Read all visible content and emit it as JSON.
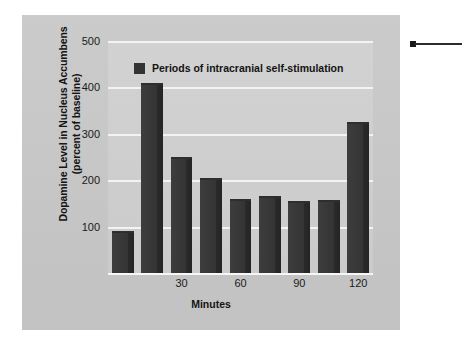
{
  "chart_data": {
    "type": "bar",
    "title": "",
    "xlabel": "Minutes",
    "ylabel": "Dopamine Level in Nucleus Accumbens\n(percent of baseline)",
    "legend": [
      {
        "label": "Periods of intracranial self-stimulation",
        "color": "#333333"
      }
    ],
    "legend_position": "inside-top-left",
    "grid": true,
    "ylim": [
      0,
      500
    ],
    "yticks": [
      100,
      200,
      300,
      400,
      500
    ],
    "xticks": [
      30,
      60,
      90,
      120
    ],
    "categories": [
      "0",
      "15",
      "30",
      "45",
      "60",
      "75",
      "90",
      "105",
      "120"
    ],
    "values": [
      90,
      410,
      250,
      205,
      160,
      167,
      155,
      157,
      325
    ],
    "bar_color": "#333333",
    "plot_background": "#cfcfcf",
    "figure_background": "#c7c7c7",
    "gridline_color": "#f3f3f3"
  },
  "annotation": {
    "leader_dot_color": "#1b1b1b",
    "leader_line_color": "#2b2b2b"
  }
}
